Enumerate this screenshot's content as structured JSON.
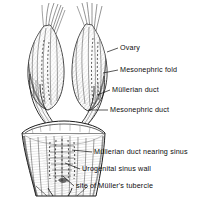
{
  "figure": {
    "background_color": "#ffffff",
    "ink_color": "#111111",
    "style": "pen-and-ink anatomical engraving, grayscale hatching"
  },
  "labels": [
    {
      "id": "ovary",
      "text": "Ovary",
      "leader_from": [
        118,
        48
      ],
      "leader_to": [
        104,
        52
      ]
    },
    {
      "id": "mesonephric-fold",
      "text": "Mesonephric fold",
      "leader_from": [
        118,
        70
      ],
      "leader_to": [
        102,
        73
      ]
    },
    {
      "id": "mullerian-duct",
      "text": "Müllerian duct",
      "leader_from": [
        110,
        90
      ],
      "leader_to": [
        96,
        95
      ]
    },
    {
      "id": "mesonephric-duct",
      "text": "Mesonephric duct",
      "leader_from": [
        108,
        110
      ],
      "leader_to": [
        88,
        110
      ]
    },
    {
      "id": "mullerian-duct-nearing-sinus",
      "text": "Müllerian duct nearing sinus",
      "leader_from": [
        92,
        152
      ],
      "leader_to": [
        72,
        149
      ]
    },
    {
      "id": "urogenital-sinus-wall",
      "text": "Urogenital sinus wall",
      "leader_from": [
        80,
        169
      ],
      "leader_to": [
        64,
        163
      ]
    },
    {
      "id": "site-of-mullers-tubercle",
      "text": "site of Müller's tubercle",
      "leader_from": [
        74,
        186
      ],
      "leader_to": [
        62,
        176
      ]
    }
  ],
  "structures": [
    {
      "id": "left-ovary",
      "name": "left ovary"
    },
    {
      "id": "right-ovary",
      "name": "right ovary"
    },
    {
      "id": "left-fimbriae",
      "name": "left fimbrial fringe"
    },
    {
      "id": "right-fimbriae",
      "name": "right fimbrial fringe"
    },
    {
      "id": "left-duct-pair",
      "name": "left Müllerian and mesonephric ducts"
    },
    {
      "id": "right-duct-pair",
      "name": "right Müllerian and mesonephric ducts"
    },
    {
      "id": "urogenital-sinus",
      "name": "urogenital sinus funnel"
    },
    {
      "id": "sinus-rim",
      "name": "cut rim of urogenital sinus"
    },
    {
      "id": "tubercle",
      "name": "Müller's tubercle"
    }
  ]
}
